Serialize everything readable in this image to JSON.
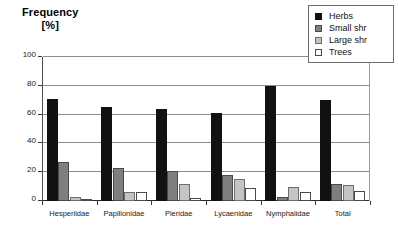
{
  "chart_data": {
    "type": "bar",
    "title": "Frequency [%]",
    "title_lines": [
      "Frequency",
      "[%]"
    ],
    "xlabel": "",
    "ylabel": "Frequency [%]",
    "ylim": [
      0,
      100
    ],
    "yticks": [
      0,
      20,
      40,
      60,
      80,
      100
    ],
    "grid": true,
    "legend_position": "top-right",
    "categories": [
      "Hesperiidae",
      "Papilionidae",
      "Pieridae",
      "Lycaenidae",
      "Nymphalidae",
      "Total"
    ],
    "series": [
      {
        "name": "Herbs",
        "color": "#111111",
        "values": [
          71,
          65,
          64,
          61,
          80,
          70
        ]
      },
      {
        "name": "Small shr",
        "color": "#7f7f7f",
        "values": [
          27,
          23,
          21,
          18,
          3,
          12
        ]
      },
      {
        "name": "Large shr",
        "color": "#c4c4c4",
        "values": [
          3,
          6,
          12,
          15,
          10,
          11
        ]
      },
      {
        "name": "Trees",
        "color": "#ffffff",
        "values": [
          0,
          6,
          2,
          9,
          6,
          7
        ]
      }
    ]
  },
  "legend": {
    "items": [
      {
        "label": "Herbs",
        "swatch": "herbs-swatch-icon"
      },
      {
        "label": "Small shr",
        "swatch": "small-shr-swatch-icon"
      },
      {
        "label": "Large shr",
        "swatch": "large-shr-swatch-icon"
      },
      {
        "label": "Trees",
        "swatch": "trees-swatch-icon"
      }
    ]
  }
}
